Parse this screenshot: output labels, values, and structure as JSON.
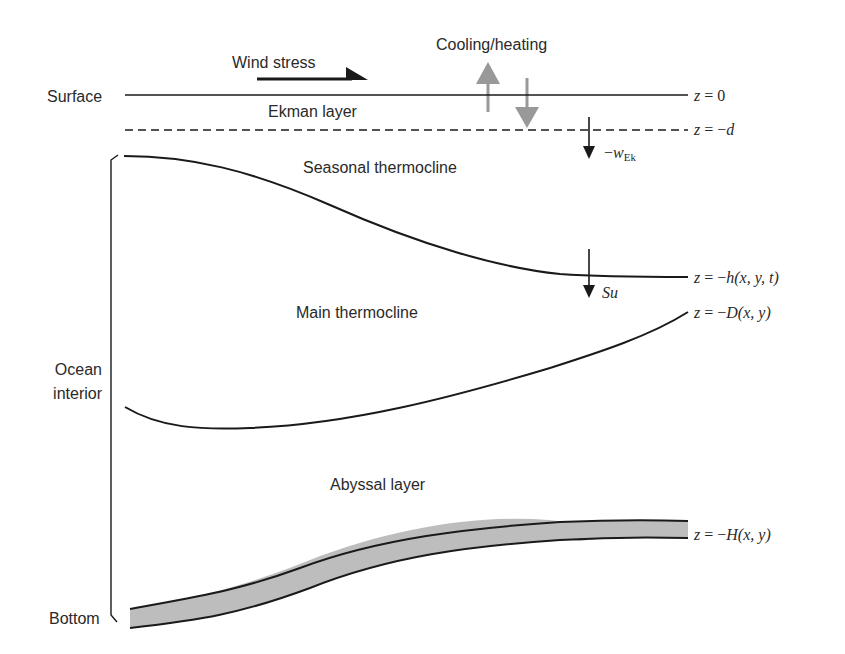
{
  "diagram": {
    "labels": {
      "wind_stress": "Wind stress",
      "cooling_heating": "Cooling/heating",
      "surface": "Surface",
      "ekman_layer": "Ekman layer",
      "seasonal_thermocline": "Seasonal thermocline",
      "main_thermocline": "Main thermocline",
      "ocean_interior_line1": "Ocean",
      "ocean_interior_line2": "interior",
      "abyssal_layer": "Abyssal layer",
      "bottom": "Bottom"
    },
    "equations": {
      "surface": {
        "lhs": "z",
        "eq": " = 0"
      },
      "ekman_base": {
        "lhs": "z",
        "eq": " = −",
        "var": "d"
      },
      "seasonal": {
        "lhs": "z",
        "eq": " = −",
        "var": "h",
        "args": "(x, y, t)"
      },
      "main": {
        "lhs": "z",
        "eq": " = −",
        "var": "D",
        "args": "(x, y)"
      },
      "bottom": {
        "lhs": "z",
        "eq": " = −",
        "var": "H",
        "args": "(x, y)"
      }
    },
    "arrows": {
      "ekman_pumping": {
        "sign": "−",
        "symbol": "w",
        "subscript": "Ek"
      },
      "subduction": {
        "symbol": "Su"
      }
    },
    "colors": {
      "line": "#1a1a1a",
      "flux_arrow": "#999999",
      "bottom_fill": "#bdbdbd",
      "text": "#2a2a2a"
    }
  }
}
